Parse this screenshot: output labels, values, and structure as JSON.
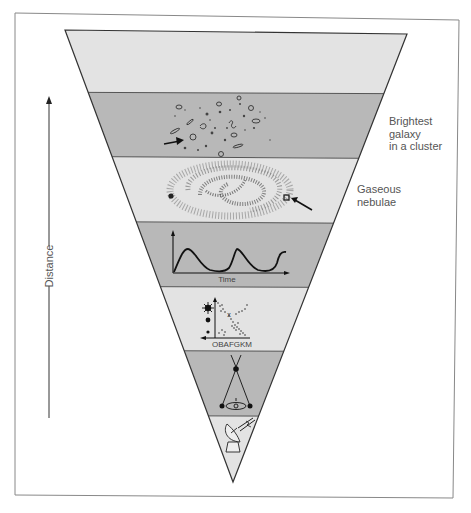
{
  "figure": {
    "type": "cosmic-distance-ladder",
    "axis_label": "Distance",
    "bands": [
      {
        "index": 1,
        "content": "empty",
        "shade": "light"
      },
      {
        "index": 2,
        "content": "galaxy-cluster",
        "shade": "dark"
      },
      {
        "index": 3,
        "content": "spiral-galaxy",
        "shade": "light"
      },
      {
        "index": 4,
        "content": "cepheid-light-curve",
        "shade": "dark"
      },
      {
        "index": 5,
        "content": "hr-diagram",
        "shade": "light"
      },
      {
        "index": 6,
        "content": "parallax",
        "shade": "dark"
      },
      {
        "index": 7,
        "content": "radar",
        "shade": "light"
      }
    ],
    "labels": {
      "galaxy_cluster": [
        "Brightest",
        "galaxy",
        "in a cluster"
      ],
      "nebulae": [
        "Gaseous",
        "nebulae"
      ]
    },
    "light_curve": {
      "x_label": "Time"
    },
    "hr_diagram": {
      "x_label": "OBAFGKM"
    },
    "colors": {
      "light_band": "#e3e3e3",
      "dark_band": "#b8b8b8",
      "line": "#333333",
      "frame": "#777777",
      "text": "#555555"
    }
  }
}
